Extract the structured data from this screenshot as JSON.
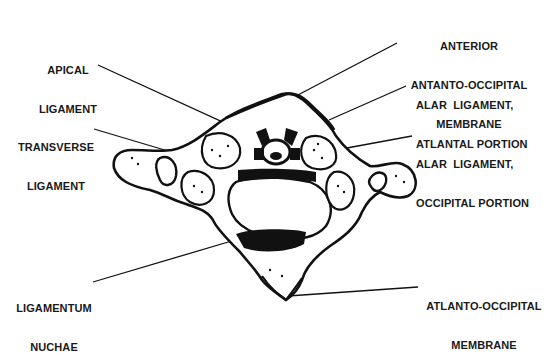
{
  "diagram": {
    "colors": {
      "ink": "#111111",
      "background": "#ffffff",
      "text": "#1a1a1a"
    }
  },
  "labels": {
    "apical_ligament": {
      "line1": "APICAL",
      "line2": "LIGAMENT"
    },
    "transverse_ligament": {
      "line1": "TRANSVERSE",
      "line2": "LIGAMENT"
    },
    "ligamentum_nuchae": {
      "line1": "LIGAMENTUM",
      "line2": "NUCHAE"
    },
    "anterior_membrane": {
      "line1": "ANTERIOR",
      "line2": "ANTANTO-OCCIPITAL",
      "line3": "MEMBRANE"
    },
    "alar_atlantal": {
      "line1": "ALAR  LIGAMENT,",
      "line2": "ATLANTAL PORTION"
    },
    "alar_occipital": {
      "line1": "ALAR  LIGAMENT,",
      "line2": "OCCIPITAL PORTION"
    },
    "atlanto_occipital_membrane": {
      "line1": "ATLANTO-OCCIPITAL",
      "line2": "MEMBRANE"
    }
  }
}
